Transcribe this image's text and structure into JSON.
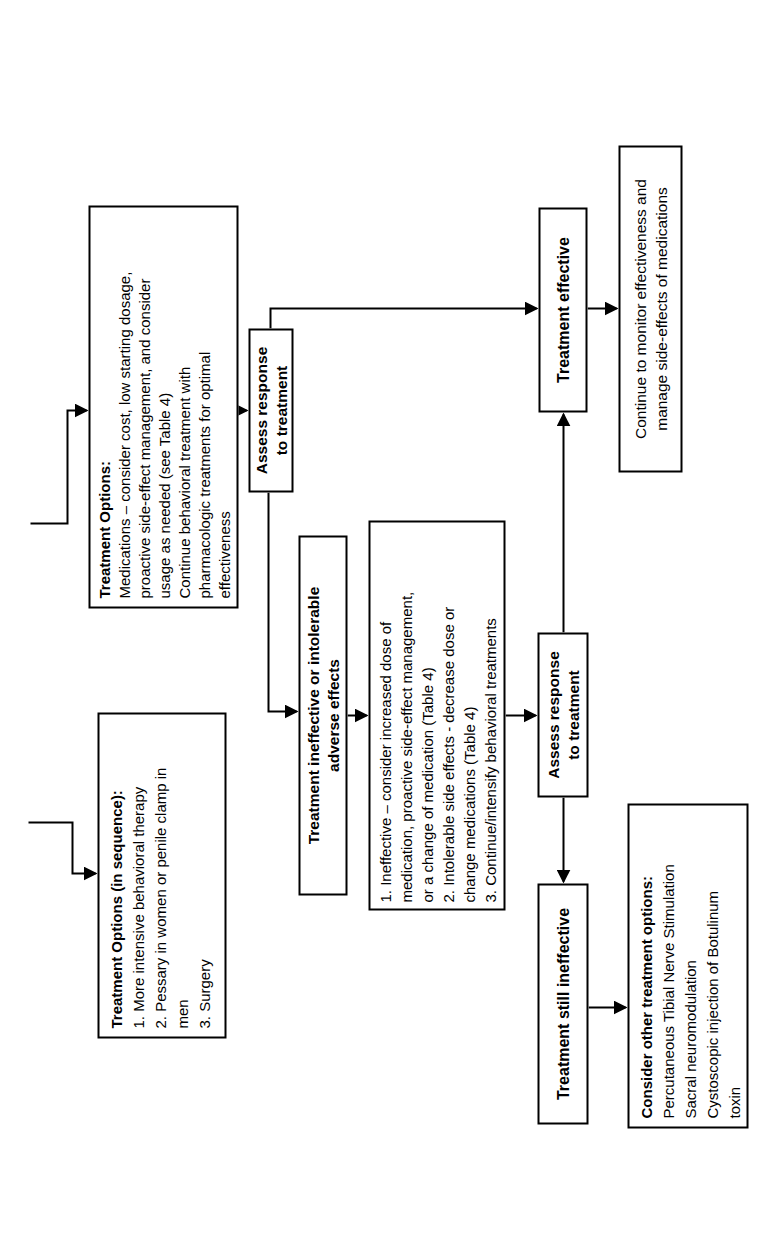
{
  "figure": {
    "background_color": "#ffffff",
    "line_color": "#000000",
    "boxes": {
      "medication_treatment_options": {
        "heading": "Treatment Options:",
        "body": "Medications – consider cost, low starting dosage,\nproactive side-effect management, and consider\nusage as needed (see Table 4)\nContinue behavioral treatment with\npharmacologic treatments for optimal\neffectiveness"
      },
      "assess_response_1": {
        "label": "Assess response\nto treatment"
      },
      "treatment_effective": {
        "label": "Treatment effective"
      },
      "monitor_effectiveness": {
        "label": "Continue to monitor effectiveness and\nmanage side-effects of medications"
      },
      "treatment_ineffective": {
        "label": "Treatment ineffective or intolerable\nadverse effects"
      },
      "adjustment_options": {
        "body": "1. Ineffective – consider increased dose of\nmedication, proactive side-effect management,\nor a change of medication (Table 4)\n2. Intolerable side effects - decrease dose or\nchange medications (Table 4)\n3. Continue/intensify behavioral treatments"
      },
      "sequence_treatment_options": {
        "heading": "Treatment Options (in sequence):",
        "body": "1. More intensive behavioral therapy\n2. Pessary in women or penile clamp in\nmen\n3. Surgery"
      },
      "assess_response_2": {
        "label": "Assess response\nto treatment"
      },
      "treatment_still_ineffective": {
        "label": "Treatment still ineffective"
      },
      "other_treatment_options": {
        "heading": "Consider other treatment options:",
        "body": "Percutaneous Tibial Nerve Stimulation\nSacral neuromodulation\nCystoscopic injection of Botulinum\ntoxin"
      }
    }
  }
}
